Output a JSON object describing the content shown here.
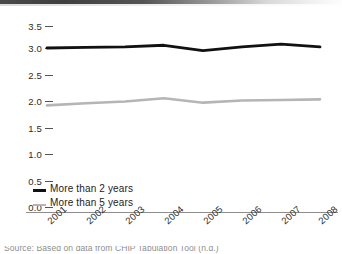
{
  "chart_data": {
    "type": "line",
    "title": "",
    "xlabel": "",
    "ylabel": "",
    "categories": [
      "2001",
      "2002",
      "2003",
      "2004",
      "2005",
      "2006",
      "2007",
      "2008"
    ],
    "series": [
      {
        "name": "More than 2 years",
        "color": "#111111",
        "values": [
          3.0,
          3.01,
          3.02,
          3.05,
          2.95,
          3.02,
          3.07,
          3.02
        ]
      },
      {
        "name": "More than 5 years",
        "color": "#b5b5b5",
        "values": [
          1.95,
          1.99,
          2.02,
          2.08,
          2.0,
          2.04,
          2.05,
          2.06
        ]
      }
    ],
    "ylim": [
      0.0,
      3.5
    ],
    "yticks": [
      "0.0",
      "0.5",
      "1.0",
      "1.5",
      "2.0",
      "2.5",
      "3.0",
      "3.5"
    ],
    "grid": false,
    "legend_position": "bottom-left"
  },
  "axis": {
    "y_tick_labels": [
      "3.5",
      "3.0",
      "2.5",
      "2.0",
      "1.5",
      "1.0",
      "0.5",
      "0.0"
    ],
    "x_tick_labels": [
      "2001",
      "2002",
      "2003",
      "2004",
      "2005",
      "2006",
      "2007",
      "2008"
    ]
  },
  "legend": {
    "items": [
      {
        "label": "More than 2 years"
      },
      {
        "label": "More than 5 years"
      }
    ]
  },
  "footnote": {
    "text": "Source: Based on data from CHIP Tabulation Tool (n.d.)"
  }
}
